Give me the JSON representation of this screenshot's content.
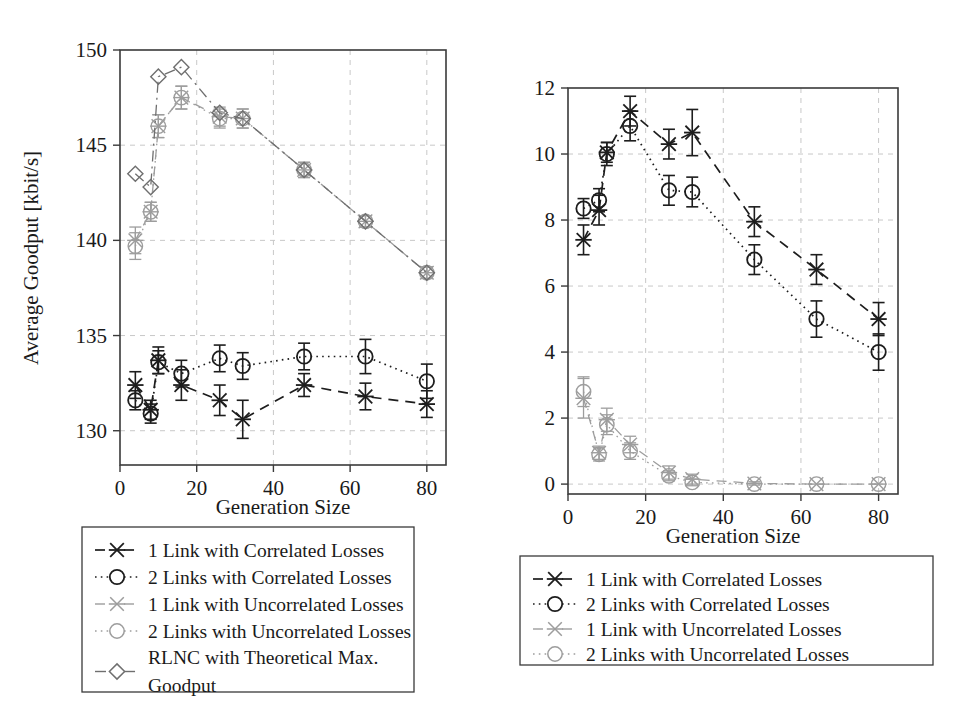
{
  "figure": {
    "panels": [
      "goodput",
      "loss"
    ]
  },
  "chart_data": [
    {
      "id": "goodput",
      "type": "line",
      "title": "",
      "xlabel": "Generation Size",
      "ylabel": "Average Goodput [kbit/s]",
      "xlim": [
        0,
        85
      ],
      "ylim": [
        128.2,
        150
      ],
      "xticks": [
        0,
        20,
        40,
        60,
        80
      ],
      "yticks": [
        130,
        135,
        140,
        145,
        150
      ],
      "grid": true,
      "legend_position": "below",
      "series": [
        {
          "name": "1 Link with Correlated Losses",
          "marker": "x",
          "line": "dashed",
          "color": "#1d1d1d",
          "x": [
            4,
            8,
            10,
            16,
            26,
            32,
            48,
            64,
            80
          ],
          "y": [
            132.4,
            131.1,
            133.7,
            132.4,
            131.6,
            130.6,
            132.4,
            131.8,
            131.4
          ],
          "yerr": [
            0.7,
            0.5,
            0.7,
            0.8,
            0.8,
            1.0,
            0.6,
            0.7,
            0.7
          ]
        },
        {
          "name": "2 Links with Correlated Losses",
          "marker": "o",
          "line": "dotted",
          "color": "#1d1d1d",
          "x": [
            4,
            8,
            10,
            16,
            26,
            32,
            48,
            64,
            80
          ],
          "y": [
            131.6,
            130.9,
            133.6,
            133.0,
            133.8,
            133.4,
            133.9,
            133.9,
            132.6
          ],
          "yerr": [
            0.5,
            0.5,
            0.6,
            0.7,
            0.7,
            0.7,
            0.7,
            0.9,
            0.9
          ]
        },
        {
          "name": "1 Link with Uncorrelated Losses",
          "marker": "x",
          "line": "dashed",
          "color": "#9d9d9d",
          "x": [
            4,
            8,
            10,
            16,
            26,
            32,
            48,
            64,
            80
          ],
          "y": [
            140.0,
            141.5,
            146.0,
            147.5,
            146.5,
            146.4,
            143.7,
            141.0,
            138.3
          ],
          "yerr": [
            0.7,
            0.5,
            0.6,
            0.6,
            0.5,
            0.5,
            0.4,
            0.3,
            0.3
          ]
        },
        {
          "name": "2 Links with Uncorrelated Losses",
          "marker": "o",
          "line": "dotted",
          "color": "#9d9d9d",
          "x": [
            4,
            8,
            10,
            16,
            26,
            32,
            48,
            64,
            80
          ],
          "y": [
            139.7,
            141.5,
            146.0,
            147.5,
            146.4,
            146.4,
            143.7,
            141.0,
            138.3
          ],
          "yerr": [
            0.7,
            0.5,
            0.6,
            0.6,
            0.5,
            0.5,
            0.4,
            0.3,
            0.3
          ]
        },
        {
          "name": "RLNC with Theoretical Max. Goodput",
          "marker": "diamond",
          "line": "dashdot",
          "color": "#6f6f6f",
          "x": [
            4,
            8,
            10,
            16,
            26,
            32,
            48,
            64,
            80
          ],
          "y": [
            143.5,
            142.8,
            148.6,
            149.1,
            146.7,
            146.4,
            143.7,
            141.0,
            138.3
          ],
          "yerr": [
            0,
            0,
            0,
            0,
            0,
            0,
            0,
            0,
            0
          ]
        }
      ]
    },
    {
      "id": "loss",
      "type": "line",
      "title": "",
      "xlabel": "Generation Size",
      "ylabel": "Average Loss [%]",
      "xlim": [
        0,
        85
      ],
      "ylim": [
        -0.3,
        12
      ],
      "xticks": [
        0,
        20,
        40,
        60,
        80
      ],
      "yticks": [
        0,
        2,
        4,
        6,
        8,
        10,
        12
      ],
      "grid": true,
      "legend_position": "below",
      "series": [
        {
          "name": "1 Link with Correlated Losses",
          "marker": "x",
          "line": "dashed",
          "color": "#1d1d1d",
          "x": [
            4,
            8,
            10,
            16,
            26,
            32,
            48,
            64,
            80
          ],
          "y": [
            7.4,
            8.3,
            10.05,
            11.3,
            10.3,
            10.65,
            7.95,
            6.5,
            5.0
          ],
          "yerr": [
            0.45,
            0.45,
            0.3,
            0.45,
            0.45,
            0.7,
            0.45,
            0.45,
            0.5
          ]
        },
        {
          "name": "2 Links with Correlated Losses",
          "marker": "o",
          "line": "dotted",
          "color": "#1d1d1d",
          "x": [
            4,
            8,
            10,
            16,
            26,
            32,
            48,
            64,
            80
          ],
          "y": [
            8.35,
            8.6,
            10.0,
            10.85,
            8.9,
            8.85,
            6.8,
            5.0,
            4.0
          ],
          "yerr": [
            0.3,
            0.35,
            0.35,
            0.45,
            0.45,
            0.45,
            0.45,
            0.55,
            0.55
          ]
        },
        {
          "name": "1 Link with Uncorrelated Losses",
          "marker": "x",
          "line": "dashed",
          "color": "#9d9d9d",
          "x": [
            4,
            8,
            10,
            16,
            26,
            32,
            48,
            64,
            80
          ],
          "y": [
            2.6,
            0.95,
            1.95,
            1.2,
            0.35,
            0.15,
            0.02,
            0.0,
            0.0
          ],
          "yerr": [
            0.6,
            0.2,
            0.35,
            0.25,
            0.2,
            0.15,
            0.05,
            0.0,
            0.0
          ]
        },
        {
          "name": "2 Links with Uncorrelated Losses",
          "marker": "o",
          "line": "dotted",
          "color": "#9d9d9d",
          "x": [
            4,
            8,
            10,
            16,
            26,
            32,
            48,
            64,
            80
          ],
          "y": [
            2.8,
            0.9,
            1.8,
            1.0,
            0.25,
            0.05,
            0.0,
            0.0,
            0.0
          ],
          "yerr": [
            0.45,
            0.2,
            0.3,
            0.25,
            0.15,
            0.1,
            0.0,
            0.0,
            0.0
          ]
        }
      ]
    }
  ],
  "left_chart": {
    "ylabel": "Average Goodput [kbit/s]",
    "xlabel": "Generation Size",
    "yticks": [
      "130",
      "135",
      "140",
      "145",
      "150"
    ],
    "xticks": [
      "0",
      "20",
      "40",
      "60",
      "80"
    ],
    "legend": [
      {
        "marker": "x",
        "line": "dashed",
        "tone": "dark",
        "label": "1 Link with Correlated Losses"
      },
      {
        "marker": "o",
        "line": "dotted",
        "tone": "dark",
        "label": "2 Links with Correlated Losses"
      },
      {
        "marker": "x",
        "line": "dashed",
        "tone": "light",
        "label": "1 Link with Uncorrelated Losses"
      },
      {
        "marker": "o",
        "line": "dotted",
        "tone": "light",
        "label": "2 Links with Uncorrelated Losses"
      },
      {
        "marker": "diamond",
        "line": "dashdot",
        "tone": "mid",
        "label": "RLNC with Theoretical Max.",
        "label2": "Goodput"
      }
    ]
  },
  "right_chart": {
    "ylabel": "Average Loss [%]",
    "xlabel": "Generation Size",
    "yticks": [
      "0",
      "2",
      "4",
      "6",
      "8",
      "10",
      "12"
    ],
    "xticks": [
      "0",
      "20",
      "40",
      "60",
      "80"
    ],
    "legend": [
      {
        "marker": "x",
        "line": "dashed",
        "tone": "dark",
        "label": "1 Link with Correlated Losses"
      },
      {
        "marker": "o",
        "line": "dotted",
        "tone": "dark",
        "label": "2 Links with Correlated Losses"
      },
      {
        "marker": "x",
        "line": "dashed",
        "tone": "light",
        "label": "1 Link with Uncorrelated Losses"
      },
      {
        "marker": "o",
        "line": "dotted",
        "tone": "light",
        "label": "2 Links with Uncorrelated Losses"
      }
    ]
  }
}
